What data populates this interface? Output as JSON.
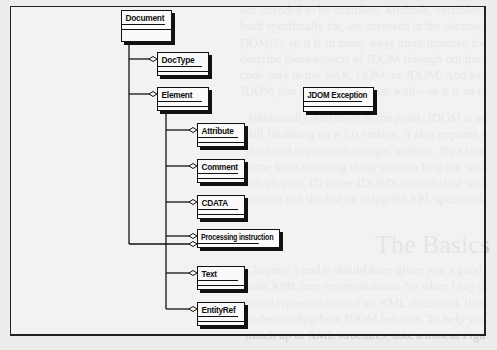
{
  "diagram": {
    "classes": {
      "document": "Document",
      "doctype": "DocType",
      "element": "Element",
      "jdom_exception": "JDOM Exception",
      "attribute": "Attribute",
      "comment": "Comment",
      "cdata": "CDATA",
      "processing_instruction": "Processing instruction",
      "text": "Text",
      "entityref": "EntityRef"
    }
  },
  "background_text": {
    "lines_top": [
      "not intended to be complete. Methods, variables, and all details of how that",
      "built specifically for, are accessed in the document — bindings for the",
      "DOM(?), so it is in many ways more intuitive for Java than DOM. I'll",
      "describe these aspects of JDOM through out the chapter to call down specific",
      "code only to use SAX, DOM, or JDOM. And a complete set of details on",
      "JDOM you should be familiar with—as it is an easy ones"
    ],
    "lines_mid": [
      "Additionally, and more to the point, JDOM is an API. And because the API is",
      "still finalizing on a 1.0 version, it also requires you have the ability to stop",
      "short and implement changes without. It's a standard since JDOM, except for",
      "some little annoying thing you can help out with is to work project. In",
      "this chapter, I'll cover JDOM's current state with regard to standard",
      "version and the last on using the API, specifically some closing examples."
    ],
    "heading": "The Basics",
    "lines_bottom": [
      "Chapters 5 and 6 should have given you a good understanding of dealing",
      "with XML tree representations. So when I say that JDOM also provides a tree-",
      "based representation of an XML document, that gives you a starting point for",
      "understanding how JDOM behaves. To help you see how the classes in JDOM",
      "match up to XML structures, take a look at Figure 7-1, which shows a UML model"
    ]
  }
}
